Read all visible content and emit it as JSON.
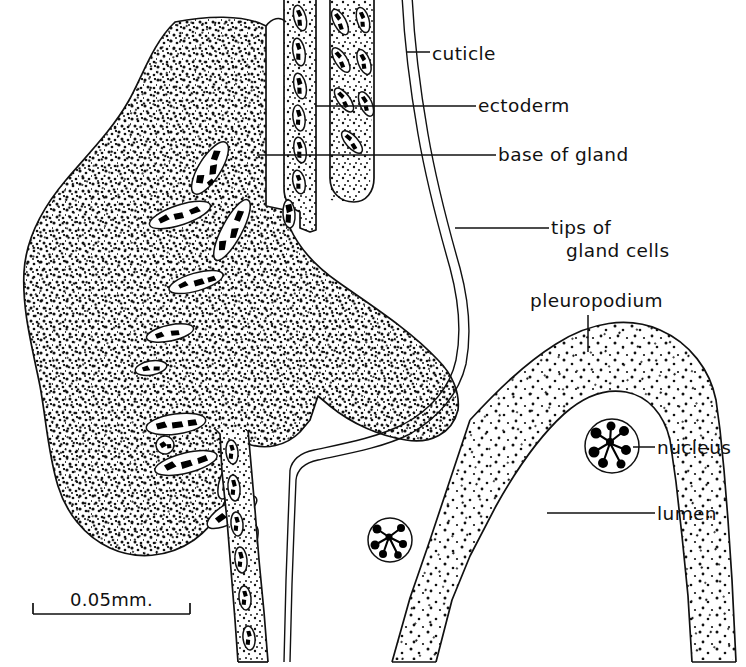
{
  "figure": {
    "background_color": "#ffffff",
    "ink_color": "#111111"
  },
  "labels": [
    {
      "id": "cuticle",
      "text": "cuticle",
      "x": 432,
      "y": 60,
      "leader": "horizontal"
    },
    {
      "id": "ectoderm",
      "text": "ectoderm",
      "x": 478,
      "y": 112,
      "leader": "horizontal"
    },
    {
      "id": "base-of-gland",
      "text": "base of gland",
      "x": 498,
      "y": 160,
      "leader": "horizontal"
    },
    {
      "id": "tips-of",
      "text": "tips of",
      "x": 551,
      "y": 228,
      "leader": "horizontal"
    },
    {
      "id": "gland-cells",
      "text": "gland cells",
      "x": 566,
      "y": 250,
      "leader": "none"
    },
    {
      "id": "pleuropodium",
      "text": "pleuropodium",
      "x": 530,
      "y": 307,
      "leader": "vertical"
    },
    {
      "id": "nucleus",
      "text": "nucleus",
      "x": 657,
      "y": 452,
      "leader": "horizontal"
    },
    {
      "id": "lumen",
      "text": "lumen",
      "x": 657,
      "y": 519,
      "leader": "horizontal"
    }
  ],
  "scale_bar": {
    "text": "0.05mm.",
    "text_x": 70,
    "text_y": 606,
    "x_start": 33,
    "x_end": 190,
    "y": 614,
    "tick_height": 11
  },
  "structures": [
    {
      "id": "gland-mass",
      "name": "gland cell mass",
      "stipple": "dense"
    },
    {
      "id": "ectoderm-band",
      "name": "ectoderm epithelium",
      "stipple": "medium"
    },
    {
      "id": "cuticle-layer",
      "name": "cuticle",
      "stipple": "none"
    },
    {
      "id": "pleuropodium-band",
      "name": "pleuropodium wall",
      "stipple": "sparse"
    },
    {
      "id": "lumen-space",
      "name": "lumen",
      "stipple": "none"
    }
  ]
}
